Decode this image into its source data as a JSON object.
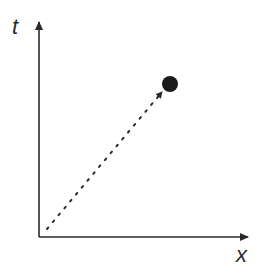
{
  "diagram": {
    "type": "spacetime-diagram",
    "axes": {
      "vertical_label": "t",
      "horizontal_label": "x"
    },
    "worldline": {
      "style": "dotted",
      "start": [
        47,
        229
      ],
      "end": [
        162,
        92
      ],
      "arrow": true
    },
    "event_dot": {
      "cx": 170,
      "cy": 84,
      "r": 8,
      "color": "#1a1a1a"
    },
    "colors": {
      "axis": "#2a2a2a",
      "background": "#ffffff"
    }
  }
}
